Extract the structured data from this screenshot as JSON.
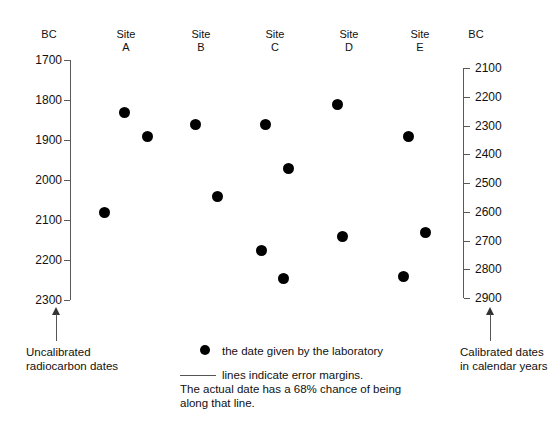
{
  "chart_data": {
    "type": "scatter",
    "title": "",
    "subtitle": "",
    "orientation": "vertical-error-bars",
    "grid": false,
    "legend_position": "bottom-center",
    "left_axis": {
      "label": "BC",
      "ticks": [
        1700,
        1800,
        1900,
        2000,
        2100,
        2200,
        2300
      ],
      "tick_labels": [
        "1700",
        "1800",
        "1900",
        "2000",
        "2100",
        "2200",
        "2300"
      ],
      "range": [
        1700,
        2300
      ],
      "caption_line1": "Uncalibrated",
      "caption_line2": "radiocarbon dates"
    },
    "right_axis": {
      "label": "BC",
      "ticks": [
        2100,
        2200,
        2300,
        2400,
        2500,
        2600,
        2700,
        2800,
        2900
      ],
      "tick_labels": [
        "2100",
        "2200",
        "2300",
        "2400",
        "2500",
        "2600",
        "2700",
        "2800",
        "2900"
      ],
      "range": [
        2100,
        2900
      ],
      "caption_line1": "Calibrated dates",
      "caption_line2": "in calendar years"
    },
    "categories": [
      "Site A",
      "Site B",
      "Site C",
      "Site D",
      "Site E"
    ],
    "series": [
      {
        "name": "Site A",
        "label_line1": "Site",
        "label_line2": "A",
        "samples": [
          {
            "date": 1830,
            "low": 1725,
            "high": 1935
          },
          {
            "date": 1890,
            "low": 1770,
            "high": 2010
          },
          {
            "date": 2080,
            "low": 1965,
            "high": 2200
          }
        ]
      },
      {
        "name": "Site B",
        "label_line1": "Site",
        "label_line2": "B",
        "samples": [
          {
            "date": 1860,
            "low": 1730,
            "high": 1990
          },
          {
            "date": 2040,
            "low": 1925,
            "high": 2160
          }
        ]
      },
      {
        "name": "Site C",
        "label_line1": "Site",
        "label_line2": "C",
        "samples": [
          {
            "date": 1860,
            "low": 1745,
            "high": 1990
          },
          {
            "date": 1970,
            "low": 1855,
            "high": 2090
          },
          {
            "date": 2175,
            "low": 2060,
            "high": 2285
          },
          {
            "date": 2245,
            "low": 2130,
            "high": 2330
          }
        ]
      },
      {
        "name": "Site D",
        "label_line1": "Site",
        "label_line2": "D",
        "samples": [
          {
            "date": 1810,
            "low": 1700,
            "high": 1935
          },
          {
            "date": 2140,
            "low": 2030,
            "high": 2270
          }
        ]
      },
      {
        "name": "Site E",
        "label_line1": "Site",
        "label_line2": "E",
        "samples": [
          {
            "date": 1890,
            "low": 1775,
            "high": 2010
          },
          {
            "date": 2130,
            "low": 2015,
            "high": 2245
          },
          {
            "date": 2240,
            "low": 2125,
            "high": 2350
          }
        ]
      }
    ],
    "legend": {
      "dot_text": "the date given by the laboratory",
      "line_text": "lines indicate error margins.",
      "note_line1": "The actual date has a 68% chance of being",
      "note_line2": "along that line."
    },
    "colors": {
      "dot": "#000000",
      "error_line": "#4a4a4a",
      "axis": "#5a5a5a",
      "text": "#111111",
      "background": "#ffffff"
    }
  }
}
